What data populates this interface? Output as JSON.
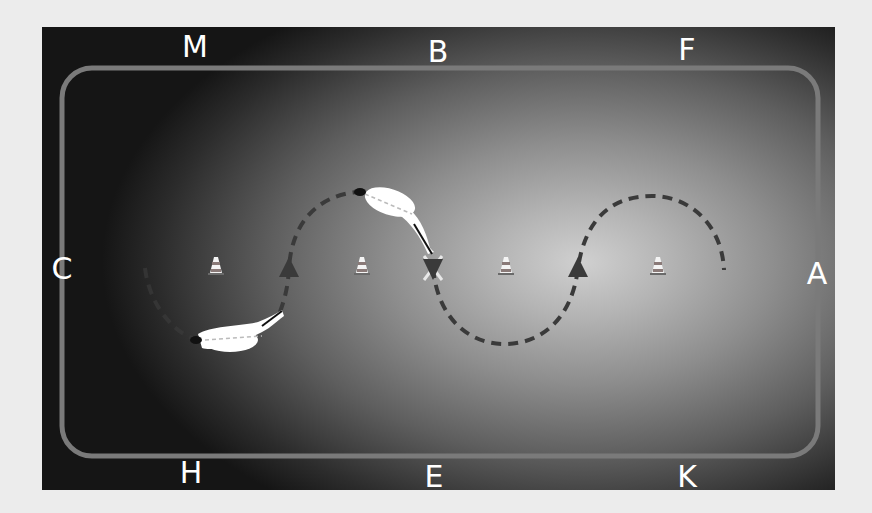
{
  "diagram": {
    "type": "dressage-arena-serpentine",
    "arena_letters": {
      "top": [
        "M",
        "B",
        "F"
      ],
      "bottom": [
        "H",
        "E",
        "K"
      ],
      "left": "C",
      "right": "A",
      "center": "X"
    },
    "cones": [
      {
        "x": 216,
        "y": 265
      },
      {
        "x": 362,
        "y": 265
      },
      {
        "x": 506,
        "y": 265
      },
      {
        "x": 658,
        "y": 265
      }
    ],
    "direction_arrows": [
      {
        "x": 289,
        "y": 268,
        "direction": "up"
      },
      {
        "x": 433,
        "y": 268,
        "direction": "down"
      },
      {
        "x": 578,
        "y": 268,
        "direction": "up"
      }
    ],
    "horses": [
      {
        "position": "lower-left loop",
        "heading": "left"
      },
      {
        "position": "upper loop near B",
        "heading": "left"
      }
    ],
    "colors": {
      "panel_dark": "#151515",
      "panel_glow": "#d0d0d0",
      "track": "#7a7a7a",
      "path": "#3a3a3a",
      "letters": "#ffffff",
      "page_background": "#ececec"
    }
  }
}
